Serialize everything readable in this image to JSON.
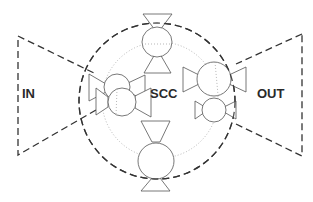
{
  "diagram": {
    "labels": {
      "input": "IN",
      "center": "SCC",
      "output": "OUT"
    },
    "regions": [
      {
        "id": "input-region",
        "label": "IN",
        "shape": "dashed trapezoid",
        "side": "left"
      },
      {
        "id": "scc-region",
        "label": "SCC",
        "shape": "dashed circle",
        "side": "center"
      },
      {
        "id": "output-region",
        "label": "OUT",
        "shape": "dashed trapezoid",
        "side": "right"
      }
    ],
    "components": [
      {
        "id": "node-top",
        "position": "top",
        "shape": "circle with bowtie triangles"
      },
      {
        "id": "node-bottom",
        "position": "bottom",
        "shape": "circle with bowtie triangles"
      },
      {
        "id": "node-left-1",
        "position": "left-upper",
        "shape": "circle with bowtie triangles"
      },
      {
        "id": "node-left-2",
        "position": "left-lower",
        "shape": "circle with bowtie triangles"
      },
      {
        "id": "node-right-1",
        "position": "right-upper",
        "shape": "circle with bowtie triangles"
      },
      {
        "id": "node-right-2",
        "position": "right-lower",
        "shape": "circle with bowtie triangles"
      }
    ],
    "colors": {
      "stroke": "#333333",
      "background": "#ffffff"
    }
  }
}
